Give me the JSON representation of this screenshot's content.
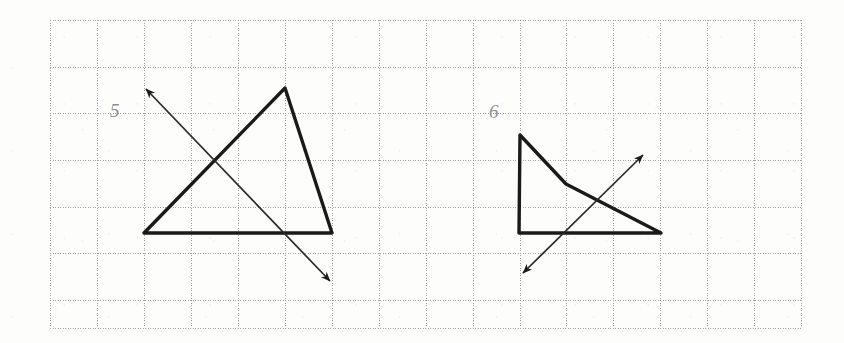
{
  "page": {
    "width": 844,
    "height": 343,
    "background_color": "#fdfdfc",
    "kind": "math-worksheet-scan"
  },
  "grid": {
    "line_color": "#9a9a9a",
    "line_style": "dotted",
    "cell_size": 46.9,
    "origin_x": 50,
    "origin_y": 20,
    "right_edge": 801,
    "bottom_edge": 328,
    "columns": 16,
    "rows": 7,
    "vertical_x": [
      50,
      97,
      144,
      191,
      238,
      285,
      332,
      379,
      426,
      473,
      520,
      566,
      613,
      660,
      707,
      754,
      801
    ],
    "horizontal_y": [
      20,
      67,
      113,
      160,
      207,
      253,
      300,
      328
    ]
  },
  "stroke": {
    "shape_color": "#1a1a1a",
    "shape_width": 3.4,
    "arrow_color": "#2a2a2a",
    "arrow_width": 1.7
  },
  "figures": [
    {
      "id": "figure-5",
      "number_label": "5",
      "label_position": {
        "x": 115,
        "y": 112
      },
      "shape": {
        "name": "triangle",
        "closed": true,
        "vertices": [
          {
            "x": 144,
            "y": 233
          },
          {
            "x": 285,
            "y": 88
          },
          {
            "x": 332,
            "y": 233
          }
        ]
      },
      "arrow": {
        "name": "line-of-symmetry-arrow",
        "double_headed": true,
        "from": {
          "x": 146,
          "y": 89
        },
        "to": {
          "x": 330,
          "y": 281
        }
      }
    },
    {
      "id": "figure-6",
      "number_label": "6",
      "label_position": {
        "x": 494,
        "y": 113
      },
      "shape": {
        "name": "dart-quadrilateral",
        "closed": true,
        "vertices": [
          {
            "x": 520,
            "y": 135
          },
          {
            "x": 566,
            "y": 184
          },
          {
            "x": 661,
            "y": 233
          },
          {
            "x": 519,
            "y": 233
          }
        ]
      },
      "arrow": {
        "name": "line-of-symmetry-arrow",
        "double_headed": true,
        "from": {
          "x": 523,
          "y": 273
        },
        "to": {
          "x": 643,
          "y": 155
        }
      }
    }
  ]
}
